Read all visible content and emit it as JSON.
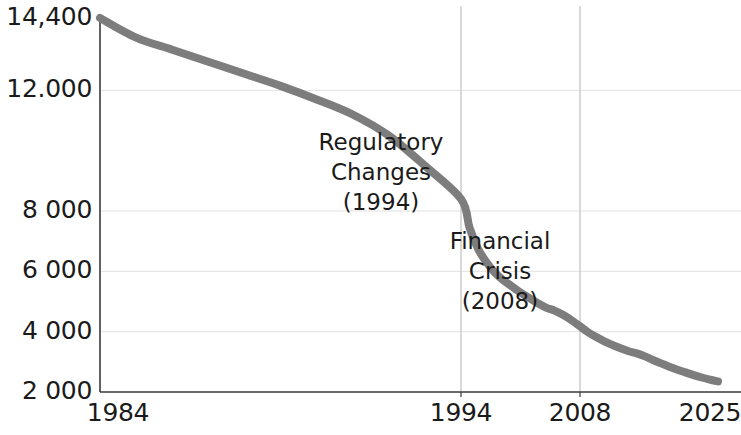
{
  "chart_data": {
    "type": "line",
    "title": "",
    "subtitle": "",
    "xlabel": "",
    "ylabel": "",
    "xlim": [
      1984,
      2025
    ],
    "ylim": [
      2000,
      14400
    ],
    "grid": true,
    "legend_position": "none",
    "line_color": "#7d7d7d",
    "axis_color": "#3a3a3a",
    "grid_color": "#e2e2e2",
    "text_color": "#1a1a1a",
    "y_ticks": [
      {
        "value": 14400,
        "label": "14,400"
      },
      {
        "value": 12000,
        "label": "12.000"
      },
      {
        "value": 8000,
        "label": "8 000"
      },
      {
        "value": 6000,
        "label": "6 000"
      },
      {
        "value": 4000,
        "label": "4 000"
      },
      {
        "value": 2000,
        "label": "2 000"
      }
    ],
    "x_ticks": [
      {
        "value": 1984,
        "label": "1984"
      },
      {
        "value": 1994,
        "label": "1994"
      },
      {
        "value": 2008,
        "label": "2008"
      },
      {
        "value": 2025,
        "label": "2025"
      }
    ],
    "reference_lines": [
      {
        "value": 1994,
        "label": "1994"
      },
      {
        "value": 2008,
        "label": "2008"
      }
    ],
    "annotations": [
      {
        "lines": [
          "Regulatory",
          "Changes",
          "(1994)"
        ],
        "x": 1994,
        "y": 10200
      },
      {
        "lines": [
          "Financial",
          "Crisis",
          "(2008)"
        ],
        "x": 2008,
        "y": 6900
      }
    ],
    "series": [
      {
        "name": "",
        "x": [
          1984,
          1985,
          1986,
          1987,
          1988,
          1989,
          1990,
          1991,
          1992,
          1993,
          1994,
          1995,
          1996,
          1997,
          1998,
          1999,
          2000,
          2001,
          2002,
          2003,
          2004,
          2005,
          2006,
          2007,
          2008,
          2009,
          2010,
          2011,
          2012,
          2013,
          2014,
          2015,
          2016,
          2017,
          2018,
          2019,
          2020,
          2021,
          2022,
          2023,
          2024,
          2025
        ],
        "values": [
          14400,
          13750,
          13350,
          12950,
          12550,
          12150,
          11700,
          11200,
          10500,
          9500,
          8400,
          7450,
          6750,
          6300,
          5950,
          5700,
          5500,
          5300,
          5120,
          4950,
          4800,
          4700,
          4560,
          4380,
          4180,
          3980,
          3820,
          3680,
          3560,
          3450,
          3350,
          3280,
          3180,
          3060,
          2950,
          2840,
          2740,
          2650,
          2560,
          2480,
          2410,
          2350
        ]
      }
    ]
  },
  "geometry": {
    "plot_left": 100,
    "plot_right": 726,
    "plot_top": 18,
    "plot_bottom": 392,
    "x_positions": {
      "1984": 100,
      "1994": 461,
      "2008": 580,
      "2025": 718
    }
  }
}
